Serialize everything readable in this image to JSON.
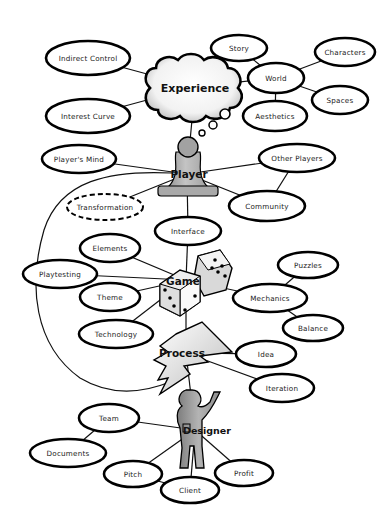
{
  "diagram": {
    "title": "",
    "hubs": [
      {
        "id": "experience",
        "label": "Experience",
        "x": 195,
        "y": 87,
        "shape": "cloud"
      },
      {
        "id": "player",
        "label": "Player",
        "x": 187,
        "y": 174,
        "shape": "pawn"
      },
      {
        "id": "game",
        "label": "Game",
        "x": 186,
        "y": 280,
        "shape": "dice"
      },
      {
        "id": "process",
        "label": "Process",
        "x": 186,
        "y": 353,
        "shape": "lightning"
      },
      {
        "id": "designer",
        "label": "Designer",
        "x": 195,
        "y": 430,
        "shape": "person"
      }
    ],
    "nodes": [
      {
        "id": "indirect_control",
        "label": "Indirect Control",
        "x": 88,
        "y": 58,
        "rx": 42,
        "ry": 17,
        "style": "solid"
      },
      {
        "id": "interest_curve",
        "label": "Interest Curve",
        "x": 88,
        "y": 116,
        "rx": 42,
        "ry": 17,
        "style": "solid"
      },
      {
        "id": "story",
        "label": "Story",
        "x": 239,
        "y": 48,
        "rx": 28,
        "ry": 13,
        "style": "solid"
      },
      {
        "id": "world",
        "label": "World",
        "x": 276,
        "y": 78,
        "rx": 28,
        "ry": 15,
        "style": "solid"
      },
      {
        "id": "characters",
        "label": "Characters",
        "x": 345,
        "y": 52,
        "rx": 30,
        "ry": 14,
        "style": "solid"
      },
      {
        "id": "spaces",
        "label": "Spaces",
        "x": 340,
        "y": 100,
        "rx": 28,
        "ry": 14,
        "style": "solid"
      },
      {
        "id": "aesthetics",
        "label": "Aesthetics",
        "x": 275,
        "y": 116,
        "rx": 32,
        "ry": 15,
        "style": "solid"
      },
      {
        "id": "players_mind",
        "label": "Player's Mind",
        "x": 79,
        "y": 159,
        "rx": 37,
        "ry": 14,
        "style": "solid"
      },
      {
        "id": "other_players",
        "label": "Other Players",
        "x": 297,
        "y": 158,
        "rx": 38,
        "ry": 14,
        "style": "solid"
      },
      {
        "id": "transformation",
        "label": "Transformation",
        "x": 105,
        "y": 207,
        "rx": 38,
        "ry": 13,
        "style": "dashed"
      },
      {
        "id": "community",
        "label": "Community",
        "x": 267,
        "y": 206,
        "rx": 38,
        "ry": 15,
        "style": "solid"
      },
      {
        "id": "interface",
        "label": "Interface",
        "x": 188,
        "y": 231,
        "rx": 33,
        "ry": 14,
        "style": "solid"
      },
      {
        "id": "elements",
        "label": "Elements",
        "x": 110,
        "y": 248,
        "rx": 30,
        "ry": 14,
        "style": "solid"
      },
      {
        "id": "playtesting",
        "label": "Playtesting",
        "x": 60,
        "y": 274,
        "rx": 37,
        "ry": 14,
        "style": "solid"
      },
      {
        "id": "theme",
        "label": "Theme",
        "x": 110,
        "y": 297,
        "rx": 30,
        "ry": 14,
        "style": "solid"
      },
      {
        "id": "technology",
        "label": "Technology",
        "x": 116,
        "y": 334,
        "rx": 37,
        "ry": 14,
        "style": "solid"
      },
      {
        "id": "puzzles",
        "label": "Puzzles",
        "x": 308,
        "y": 265,
        "rx": 30,
        "ry": 13,
        "style": "solid"
      },
      {
        "id": "mechanics",
        "label": "Mechanics",
        "x": 270,
        "y": 298,
        "rx": 37,
        "ry": 14,
        "style": "solid"
      },
      {
        "id": "balance",
        "label": "Balance",
        "x": 313,
        "y": 328,
        "rx": 30,
        "ry": 13,
        "style": "solid"
      },
      {
        "id": "idea",
        "label": "Idea",
        "x": 266,
        "y": 354,
        "rx": 30,
        "ry": 13,
        "style": "solid"
      },
      {
        "id": "iteration",
        "label": "Iteration",
        "x": 282,
        "y": 388,
        "rx": 32,
        "ry": 14,
        "style": "solid"
      },
      {
        "id": "team",
        "label": "Team",
        "x": 109,
        "y": 418,
        "rx": 30,
        "ry": 14,
        "style": "solid"
      },
      {
        "id": "documents",
        "label": "Documents",
        "x": 68,
        "y": 453,
        "rx": 38,
        "ry": 14,
        "style": "solid"
      },
      {
        "id": "pitch",
        "label": "Pitch",
        "x": 133,
        "y": 474,
        "rx": 29,
        "ry": 13,
        "style": "solid"
      },
      {
        "id": "client",
        "label": "Client",
        "x": 190,
        "y": 490,
        "rx": 29,
        "ry": 13,
        "style": "solid"
      },
      {
        "id": "profit",
        "label": "Profit",
        "x": 244,
        "y": 473,
        "rx": 29,
        "ry": 13,
        "style": "solid"
      }
    ],
    "edges": [
      [
        "indirect_control",
        "experience"
      ],
      [
        "interest_curve",
        "experience"
      ],
      [
        "experience",
        "world"
      ],
      [
        "story",
        "world"
      ],
      [
        "characters",
        "world"
      ],
      [
        "spaces",
        "world"
      ],
      [
        "aesthetics",
        "world"
      ],
      [
        "experience",
        "player"
      ],
      [
        "players_mind",
        "player"
      ],
      [
        "other_players",
        "player"
      ],
      [
        "transformation",
        "player"
      ],
      [
        "community",
        "player"
      ],
      [
        "other_players",
        "community"
      ],
      [
        "player",
        "interface"
      ],
      [
        "interface",
        "game"
      ],
      [
        "elements",
        "game"
      ],
      [
        "playtesting",
        "game"
      ],
      [
        "theme",
        "game"
      ],
      [
        "technology",
        "game"
      ],
      [
        "mechanics",
        "game"
      ],
      [
        "puzzles",
        "mechanics"
      ],
      [
        "balance",
        "mechanics"
      ],
      [
        "game",
        "process"
      ],
      [
        "idea",
        "process"
      ],
      [
        "iteration",
        "process"
      ],
      [
        "process",
        "designer"
      ],
      [
        "team",
        "designer"
      ],
      [
        "documents",
        "team"
      ],
      [
        "pitch",
        "designer"
      ],
      [
        "client",
        "designer"
      ],
      [
        "profit",
        "designer"
      ],
      [
        "pitch",
        "client"
      ]
    ],
    "colors": {
      "stroke": "#000000",
      "fill": "#ffffff",
      "hub_gray": "#a8a8a8",
      "hub_light": "#e6e6e6"
    }
  }
}
